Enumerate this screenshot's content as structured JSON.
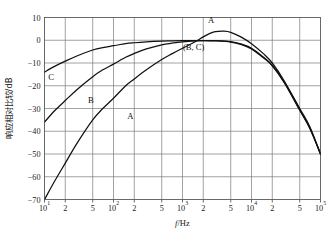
{
  "chart_data": {
    "type": "line",
    "title": "",
    "xlabel": "f/Hz",
    "ylabel": "响应相对比较/dB",
    "xscale": "log",
    "xlim": [
      10,
      100000
    ],
    "ylim": [
      -70,
      10
    ],
    "grid": true,
    "legend_position": "inline-curve-labels",
    "x_tick_labels": [
      "10",
      "2",
      "5",
      "10",
      "2",
      "5",
      "10",
      "2",
      "5",
      "10",
      "2",
      "5",
      "10"
    ],
    "x_tick_exponents": [
      "1",
      "",
      "",
      "2",
      "",
      "",
      "3",
      "",
      "",
      "4",
      "",
      "",
      "5"
    ],
    "x_tick_values": [
      10,
      20,
      50,
      100,
      200,
      500,
      1000,
      2000,
      5000,
      10000,
      20000,
      50000,
      100000
    ],
    "y_tick_labels": [
      "10",
      "0",
      "−10",
      "−20",
      "−30",
      "−40",
      "−50",
      "−60",
      "−70"
    ],
    "y_tick_values": [
      10,
      0,
      -10,
      -20,
      -30,
      -40,
      -50,
      -60,
      -70
    ],
    "series": [
      {
        "name": "A",
        "label": "A",
        "color": "#111111",
        "x": [
          10,
          14,
          20,
          30,
          50,
          70,
          100,
          150,
          200,
          300,
          500,
          700,
          1000,
          1500,
          2000,
          2500,
          3000,
          4000,
          5000,
          7000,
          10000,
          15000,
          20000,
          30000,
          50000,
          70000,
          100000
        ],
        "y": [
          -70,
          -62,
          -54,
          -45,
          -35,
          -30,
          -25.5,
          -20,
          -17,
          -13,
          -8.5,
          -6,
          -3.5,
          -0.8,
          1.5,
          3,
          3.8,
          4,
          3.5,
          1.5,
          -1.5,
          -6,
          -10,
          -18,
          -30,
          -38,
          -50
        ]
      },
      {
        "name": "B",
        "label": "B",
        "color": "#111111",
        "x": [
          10,
          14,
          20,
          30,
          50,
          70,
          100,
          150,
          200,
          300,
          500,
          700,
          1000,
          1500,
          2000,
          3000,
          5000,
          7000,
          10000,
          15000,
          20000,
          30000,
          50000,
          70000,
          100000
        ],
        "y": [
          -36,
          -31,
          -26.5,
          -21.5,
          -16,
          -13,
          -10.5,
          -7.5,
          -5.8,
          -3.8,
          -2,
          -1.3,
          -0.7,
          -0.3,
          -0.2,
          -0.2,
          -0.6,
          -1.6,
          -3.5,
          -7.5,
          -11,
          -18.5,
          -30.5,
          -38.5,
          -50
        ]
      },
      {
        "name": "C",
        "label": "C",
        "color": "#111111",
        "x": [
          10,
          14,
          20,
          30,
          50,
          70,
          100,
          150,
          200,
          300,
          500,
          700,
          1000,
          1500,
          2000,
          3000,
          5000,
          7000,
          10000,
          15000,
          20000,
          30000,
          50000,
          70000,
          100000
        ],
        "y": [
          -14,
          -11.5,
          -9.2,
          -6.8,
          -4.3,
          -3.2,
          -2.4,
          -1.5,
          -1.1,
          -0.7,
          -0.35,
          -0.25,
          -0.2,
          -0.15,
          -0.15,
          -0.3,
          -0.8,
          -1.8,
          -3.8,
          -7.8,
          -11.3,
          -18.8,
          -30.8,
          -38.8,
          -50
        ]
      }
    ],
    "annotations": [
      {
        "text": "A",
        "x": 2600,
        "y": 7.6,
        "name": "curve-label-a-peak"
      },
      {
        "text": "(B, C)",
        "x": 1450,
        "y": -4.2,
        "name": "curve-label-bc-peak"
      },
      {
        "text": "C",
        "x": 12.5,
        "y": -17.5,
        "name": "curve-label-c-left"
      },
      {
        "text": "B",
        "x": 47,
        "y": -27.5,
        "name": "curve-label-b-left"
      },
      {
        "text": "A",
        "x": 175,
        "y": -34.5,
        "name": "curve-label-a-left"
      }
    ]
  }
}
